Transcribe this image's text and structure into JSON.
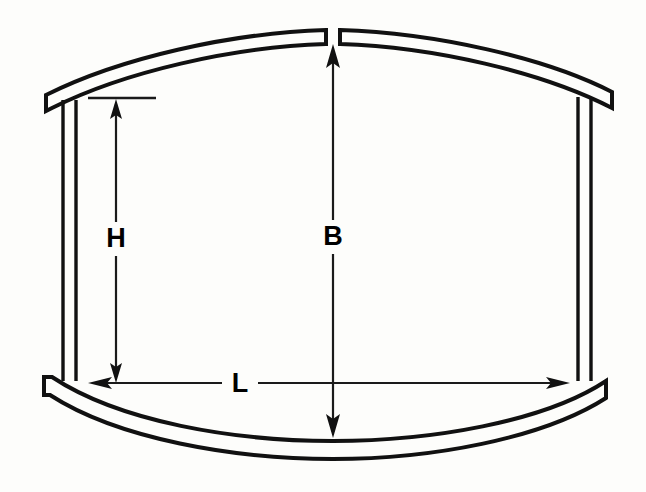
{
  "diagram": {
    "background_color": "#fdfdfb",
    "line_color": "#111111",
    "labels": {
      "height": "H",
      "bulge": "B",
      "length": "L"
    },
    "annotations": [
      {
        "name": "height-dimension",
        "label": "H",
        "orientation": "vertical",
        "arrow_style": "double-headed",
        "description": "straight side height measured from top reference tick to bottom rim line"
      },
      {
        "name": "bulge-dimension",
        "label": "B",
        "orientation": "vertical",
        "arrow_style": "double-headed",
        "description": "overall bulged height measured from top arc crown to bottom arc trough"
      },
      {
        "name": "length-dimension",
        "label": "L",
        "orientation": "horizontal",
        "arrow_style": "double-headed",
        "description": "width measured between left and right posts at the bottom rim"
      }
    ],
    "parts": [
      {
        "name": "top-arc-band",
        "shape": "arc",
        "split": true
      },
      {
        "name": "bottom-arc-band",
        "shape": "arc",
        "split": false
      },
      {
        "name": "left-post",
        "shape": "double-vertical-line"
      },
      {
        "name": "right-post",
        "shape": "double-vertical-line"
      },
      {
        "name": "height-reference-tick",
        "shape": "horizontal-line"
      }
    ]
  }
}
